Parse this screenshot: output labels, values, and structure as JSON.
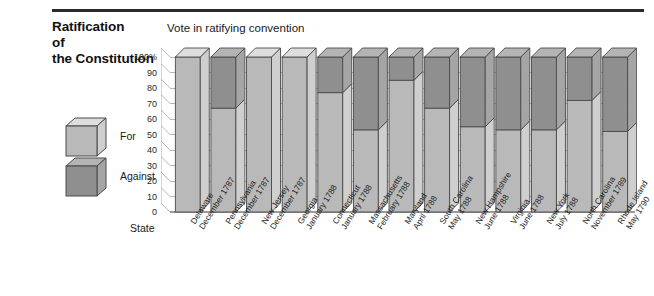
{
  "title": {
    "line1": "Ratification",
    "line2": "of",
    "line3": "the Constitution"
  },
  "legend": {
    "position": "left",
    "items": [
      {
        "label": "For",
        "color": "#b9b9b9",
        "icon": "cube-icon"
      },
      {
        "label": "Against",
        "color": "#8f8f8f",
        "icon": "cube-icon"
      }
    ]
  },
  "axes": {
    "xlabel": "State",
    "ylabel": "",
    "yticks": [
      "100%",
      "90",
      "80",
      "70",
      "60",
      "50",
      "40",
      "30",
      "20",
      "10",
      "0"
    ]
  },
  "colors": {
    "for": "#b9b9b9",
    "against": "#8f8f8f",
    "for_side": "#cfcfcf",
    "against_side": "#a5a5a5",
    "for_top": "#dedede",
    "against_top": "#b4b4b4",
    "outline": "#4a4a4a",
    "grid": "#9a9a9a",
    "rule": "#2b2b2b"
  },
  "chart_data": {
    "type": "bar",
    "title": "Vote in ratifying convention",
    "subtitle": "Ratification of the Constitution",
    "xlabel": "State",
    "ylabel": "",
    "ylim": [
      0,
      100
    ],
    "yticks": [
      0,
      10,
      20,
      30,
      40,
      50,
      60,
      70,
      80,
      90,
      100
    ],
    "units": "percent",
    "stacked": true,
    "grid": true,
    "legend": [
      "For",
      "Against"
    ],
    "categories": [
      "Delaware December 1787",
      "Pennsylvania December 1787",
      "New Jersey December 1787",
      "Georgia January 1788",
      "Connecticut January 1788",
      "Massachusetts February 1788",
      "Maryland April 1788",
      "South Carolina May 1788",
      "New Hampshire June 1788",
      "Virginia June 1788",
      "New York July 1788",
      "North Carolina November 1789",
      "Rhode Island May 1790"
    ],
    "states": [
      {
        "state": "Delaware",
        "month": "December",
        "year": "1787",
        "for": 100,
        "against": 0
      },
      {
        "state": "Pennsylvania",
        "month": "December",
        "year": "1787",
        "for": 67,
        "against": 33
      },
      {
        "state": "New Jersey",
        "month": "December",
        "year": "1787",
        "for": 100,
        "against": 0
      },
      {
        "state": "Georgia",
        "month": "January",
        "year": "1788",
        "for": 100,
        "against": 0
      },
      {
        "state": "Connecticut",
        "month": "January",
        "year": "1788",
        "for": 77,
        "against": 23
      },
      {
        "state": "Massachusetts",
        "month": "February",
        "year": "1788",
        "for": 53,
        "against": 47
      },
      {
        "state": "Maryland",
        "month": "April",
        "year": "1788",
        "for": 85,
        "against": 15
      },
      {
        "state": "South Carolina",
        "month": "May",
        "year": "1788",
        "for": 67,
        "against": 33
      },
      {
        "state": "New Hampshire",
        "month": "June",
        "year": "1788",
        "for": 55,
        "against": 45
      },
      {
        "state": "Virginia",
        "month": "June",
        "year": "1788",
        "for": 53,
        "against": 47
      },
      {
        "state": "New York",
        "month": "July",
        "year": "1788",
        "for": 53,
        "against": 47
      },
      {
        "state": "North Carolina",
        "month": "November",
        "year": "1789",
        "for": 72,
        "against": 28
      },
      {
        "state": "Rhode Island",
        "month": "May",
        "year": "1790",
        "for": 52,
        "against": 48
      }
    ],
    "series": [
      {
        "name": "For",
        "values": [
          100,
          67,
          100,
          100,
          77,
          53,
          85,
          67,
          55,
          53,
          53,
          72,
          52
        ]
      },
      {
        "name": "Against",
        "values": [
          0,
          33,
          0,
          0,
          23,
          47,
          15,
          33,
          45,
          47,
          47,
          28,
          48
        ]
      }
    ]
  }
}
